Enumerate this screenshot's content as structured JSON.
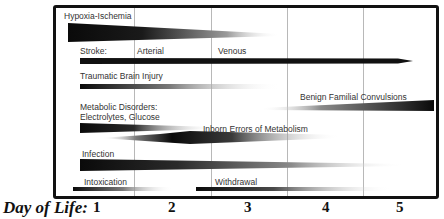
{
  "diagram": {
    "x_axis": {
      "label": "Day of Life:",
      "ticks": [
        "1",
        "2",
        "3",
        "4",
        "5"
      ]
    },
    "rows": [
      {
        "id": "hypoxia-ischemia",
        "label": "Hypoxia-Ischemia",
        "start_day": 1,
        "shape": "tapering wedge, darkest at onset, fading by ~day 3"
      },
      {
        "id": "stroke",
        "label": "Stroke:",
        "sublabels": [
          "Arterial",
          "Venous"
        ],
        "shape": "solid arrow extending through day 5"
      },
      {
        "id": "traumatic-brain-injury",
        "label": "Traumatic Brain Injury",
        "shape": "fading bar, day 1 to ~day 3"
      },
      {
        "id": "benign-familial-convulsions",
        "label": "Benign Familial Convulsions",
        "shape": "growing wedge from ~day 3 to beyond day 5"
      },
      {
        "id": "metabolic-disorders",
        "label": "Metabolic Disorders:",
        "label_line2": "Electrolytes, Glucose",
        "shape": "fading bar, day 1 to ~day 2.5"
      },
      {
        "id": "inborn-errors",
        "label": "Inborn Errors of Metabolism",
        "shape": "spindle peaking around day 2, fading by ~day 3.5"
      },
      {
        "id": "infection",
        "label": "Infection",
        "shape": "fading bar, day 1 to ~day 5"
      },
      {
        "id": "intoxication",
        "label": "Intoxication",
        "shape": "fading bar, day 1 to ~day 2"
      },
      {
        "id": "withdrawal",
        "label": "Withdrawal",
        "shape": "fading bar, ~day 2.5 to ~day 4.5"
      }
    ],
    "colors": {
      "bar": "#111111",
      "frame": "#111111",
      "gridline": "#b8b8b8",
      "text": "#333333"
    }
  }
}
